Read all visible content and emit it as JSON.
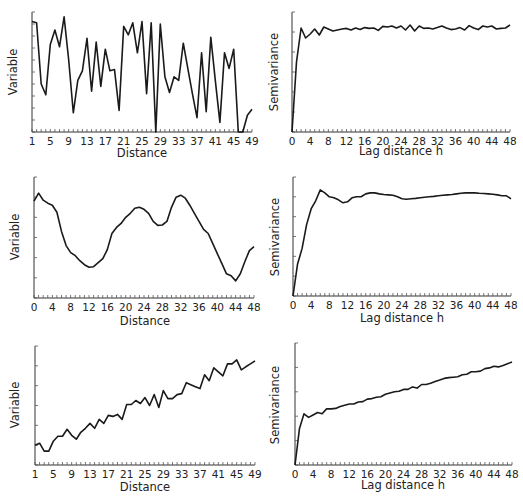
{
  "figure": {
    "layout": "3 rows x 2 columns",
    "background": "#ffffff",
    "line_color": "#1a1a1a"
  },
  "chart_data": [
    {
      "id": "top-left",
      "type": "line",
      "title": "",
      "xlabel": "Distance",
      "ylabel": "Variable",
      "x_tick_labels": [
        "1",
        "5",
        "9",
        "13",
        "17",
        "21",
        "25",
        "29",
        "33",
        "37",
        "41",
        "45",
        "49"
      ],
      "xlim": [
        1,
        49
      ],
      "ylim": [
        0,
        10
      ],
      "y_tick_count": 10,
      "grid": false,
      "x": [
        1,
        2,
        3,
        4,
        5,
        6,
        7,
        8,
        9,
        10,
        11,
        12,
        13,
        14,
        15,
        16,
        17,
        18,
        19,
        20,
        21,
        22,
        23,
        24,
        25,
        26,
        27,
        28,
        29,
        30,
        31,
        32,
        33,
        34,
        35,
        36,
        37,
        38,
        39,
        40,
        41,
        42,
        43,
        44,
        45,
        46,
        47,
        48,
        49
      ],
      "values": [
        9.2,
        9.1,
        4.0,
        3.1,
        7.3,
        8.5,
        7.1,
        9.6,
        6.0,
        1.6,
        4.3,
        5.1,
        7.8,
        3.4,
        7.5,
        3.8,
        6.9,
        5.1,
        5.2,
        1.8,
        8.8,
        8.1,
        9.1,
        6.6,
        9.2,
        3.2,
        9.1,
        0.0,
        9.0,
        4.6,
        3.3,
        4.6,
        4.3,
        7.4,
        5.3,
        3.2,
        1.2,
        6.6,
        1.7,
        7.9,
        4.3,
        0.8,
        6.6,
        5.3,
        6.9,
        0.0,
        0.0,
        1.4,
        1.9,
        7.3
      ]
    },
    {
      "id": "top-right",
      "type": "line",
      "title": "",
      "xlabel": "Lag distance h",
      "ylabel": "Semivariance",
      "x_tick_labels": [
        "0",
        "4",
        "8",
        "12",
        "16",
        "20",
        "24",
        "28",
        "32",
        "36",
        "40",
        "44",
        "48"
      ],
      "xlim": [
        0,
        48
      ],
      "ylim": [
        0,
        6
      ],
      "y_tick_count": 6,
      "grid": false,
      "x": [
        0,
        1,
        2,
        3,
        4,
        5,
        6,
        7,
        8,
        9,
        10,
        11,
        12,
        13,
        14,
        15,
        16,
        17,
        18,
        19,
        20,
        21,
        22,
        23,
        24,
        25,
        26,
        27,
        28,
        29,
        30,
        31,
        32,
        33,
        34,
        35,
        36,
        37,
        38,
        39,
        40,
        41,
        42,
        43,
        44,
        45,
        46,
        47,
        48
      ],
      "values": [
        0.0,
        3.5,
        5.2,
        4.7,
        4.9,
        5.15,
        4.85,
        5.25,
        5.15,
        5.05,
        5.1,
        5.15,
        5.18,
        5.1,
        5.2,
        5.12,
        5.22,
        5.18,
        5.2,
        5.08,
        5.28,
        5.25,
        5.3,
        5.2,
        5.3,
        5.1,
        5.35,
        5.05,
        5.3,
        5.18,
        5.2,
        5.15,
        5.22,
        5.3,
        5.2,
        5.12,
        5.15,
        5.22,
        5.1,
        5.32,
        5.2,
        5.12,
        5.3,
        5.25,
        5.3,
        5.15,
        5.18,
        5.2,
        5.35
      ]
    },
    {
      "id": "middle-left",
      "type": "line",
      "title": "",
      "xlabel": "Distance",
      "ylabel": "Variable",
      "x_tick_labels": [
        "0",
        "4",
        "8",
        "12",
        "16",
        "20",
        "24",
        "28",
        "32",
        "36",
        "40",
        "44",
        "48"
      ],
      "xlim": [
        0,
        48
      ],
      "ylim": [
        0,
        6
      ],
      "y_tick_count": 6,
      "grid": false,
      "x": [
        0,
        1,
        2,
        3,
        4,
        5,
        6,
        7,
        8,
        9,
        10,
        11,
        12,
        13,
        14,
        15,
        16,
        17,
        18,
        19,
        20,
        21,
        22,
        23,
        24,
        25,
        26,
        27,
        28,
        29,
        30,
        31,
        32,
        33,
        34,
        35,
        36,
        37,
        38,
        39,
        40,
        41,
        42,
        43,
        44,
        45,
        46,
        47,
        48
      ],
      "values": [
        4.8,
        5.2,
        4.85,
        4.7,
        4.6,
        4.25,
        3.3,
        2.6,
        2.25,
        2.1,
        1.85,
        1.65,
        1.52,
        1.55,
        1.75,
        1.95,
        2.4,
        3.2,
        3.5,
        3.7,
        4.0,
        4.2,
        4.45,
        4.5,
        4.4,
        4.2,
        3.8,
        3.6,
        3.62,
        3.8,
        4.5,
        5.0,
        5.1,
        4.95,
        4.6,
        4.2,
        3.8,
        3.4,
        3.2,
        2.7,
        2.2,
        1.7,
        1.2,
        1.1,
        0.85,
        1.2,
        1.8,
        2.35,
        2.55
      ]
    },
    {
      "id": "middle-right",
      "type": "line",
      "title": "",
      "xlabel": "Lag distance h",
      "ylabel": "Semivariance",
      "x_tick_labels": [
        "0",
        "4",
        "8",
        "12",
        "16",
        "20",
        "24",
        "28",
        "32",
        "36",
        "40",
        "44",
        "48"
      ],
      "xlim": [
        0,
        48
      ],
      "ylim": [
        0,
        6
      ],
      "y_tick_count": 6,
      "grid": false,
      "x": [
        0,
        1,
        2,
        3,
        4,
        5,
        6,
        7,
        8,
        9,
        10,
        11,
        12,
        13,
        14,
        15,
        16,
        17,
        18,
        19,
        20,
        21,
        22,
        23,
        24,
        25,
        26,
        27,
        28,
        29,
        30,
        31,
        32,
        33,
        34,
        35,
        36,
        37,
        38,
        39,
        40,
        41,
        42,
        43,
        44,
        45,
        46,
        47,
        48
      ],
      "values": [
        0.0,
        1.6,
        2.4,
        3.6,
        4.4,
        4.8,
        5.35,
        5.2,
        5.0,
        4.95,
        4.85,
        4.7,
        4.75,
        4.95,
        5.0,
        5.0,
        5.15,
        5.2,
        5.2,
        5.15,
        5.12,
        5.1,
        5.08,
        5.0,
        4.9,
        4.88,
        4.9,
        4.92,
        4.95,
        4.98,
        5.0,
        5.02,
        5.05,
        5.08,
        5.1,
        5.12,
        5.15,
        5.18,
        5.2,
        5.2,
        5.2,
        5.18,
        5.17,
        5.15,
        5.13,
        5.1,
        5.05,
        5.05,
        4.9
      ]
    },
    {
      "id": "bottom-left",
      "type": "line",
      "title": "",
      "xlabel": "Distance",
      "ylabel": "Variable",
      "x_tick_labels": [
        "1",
        "5",
        "9",
        "13",
        "17",
        "21",
        "25",
        "29",
        "33",
        "37",
        "41",
        "45",
        "49"
      ],
      "xlim": [
        1,
        49
      ],
      "ylim": [
        0,
        6
      ],
      "y_tick_count": 6,
      "grid": false,
      "x": [
        1,
        2,
        3,
        4,
        5,
        6,
        7,
        8,
        9,
        10,
        11,
        12,
        13,
        14,
        15,
        16,
        17,
        18,
        19,
        20,
        21,
        22,
        23,
        24,
        25,
        26,
        27,
        28,
        29,
        30,
        31,
        32,
        33,
        34,
        35,
        36,
        37,
        38,
        39,
        40,
        41,
        42,
        43,
        44,
        45,
        46,
        47,
        48,
        49
      ],
      "values": [
        1.0,
        1.1,
        0.7,
        0.7,
        1.2,
        1.45,
        1.45,
        1.8,
        1.5,
        1.3,
        1.65,
        1.85,
        2.1,
        1.85,
        2.3,
        2.1,
        2.5,
        2.45,
        2.55,
        2.3,
        3.05,
        3.05,
        3.25,
        3.1,
        3.4,
        3.0,
        3.55,
        2.9,
        3.75,
        3.35,
        3.35,
        3.55,
        3.6,
        4.15,
        4.05,
        3.95,
        3.85,
        4.55,
        4.25,
        4.9,
        4.7,
        4.5,
        5.1,
        5.1,
        5.3,
        4.8,
        4.95,
        5.1,
        5.25,
        5.85
      ]
    },
    {
      "id": "bottom-right",
      "type": "line",
      "title": "",
      "xlabel": "Lag distance h",
      "ylabel": "Semivariance",
      "x_tick_labels": [
        "0",
        "4",
        "8",
        "12",
        "16",
        "20",
        "24",
        "28",
        "32",
        "36",
        "40",
        "44",
        "48"
      ],
      "xlim": [
        0,
        48
      ],
      "ylim": [
        0,
        5
      ],
      "y_tick_count": 5,
      "grid": false,
      "x": [
        0,
        1,
        2,
        3,
        4,
        5,
        6,
        7,
        8,
        9,
        10,
        11,
        12,
        13,
        14,
        15,
        16,
        17,
        18,
        19,
        20,
        21,
        22,
        23,
        24,
        25,
        26,
        27,
        28,
        29,
        30,
        31,
        32,
        33,
        34,
        35,
        36,
        37,
        38,
        39,
        40,
        41,
        42,
        43,
        44,
        45,
        46,
        47,
        48
      ],
      "values": [
        0.0,
        1.5,
        2.1,
        1.95,
        2.05,
        2.15,
        2.1,
        2.3,
        2.3,
        2.32,
        2.4,
        2.45,
        2.5,
        2.5,
        2.58,
        2.6,
        2.7,
        2.72,
        2.78,
        2.8,
        2.9,
        2.95,
        3.0,
        3.02,
        3.1,
        3.1,
        3.2,
        3.15,
        3.3,
        3.3,
        3.35,
        3.42,
        3.48,
        3.55,
        3.58,
        3.6,
        3.62,
        3.7,
        3.72,
        3.82,
        3.82,
        3.85,
        3.95,
        3.98,
        4.05,
        4.02,
        4.08,
        4.15,
        4.22
      ]
    }
  ]
}
